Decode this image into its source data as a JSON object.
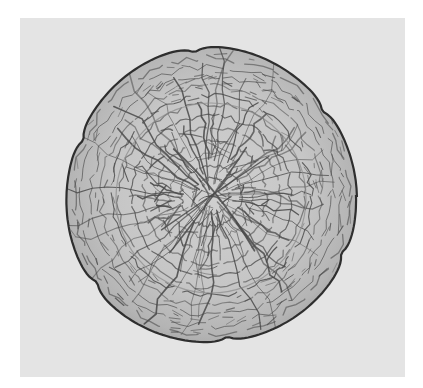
{
  "image": {
    "subject": "crackle-glazed ceramic dish with lobed rim",
    "view": "top-down",
    "background_color": "#e4e4e4",
    "page_color": "#ffffff",
    "glaze_color": "#c2c2c2",
    "glaze_highlight_color": "#d2d2d2",
    "crackle_color": "#4a4a4a",
    "rim_color": "#2e2e2e"
  },
  "layout": {
    "panel": {
      "x": 20,
      "y": 18,
      "width": 385,
      "height": 359
    },
    "dish": {
      "cx": 211,
      "cy": 196,
      "r": 145,
      "inner_well_r": 95,
      "lobes": 6
    }
  }
}
